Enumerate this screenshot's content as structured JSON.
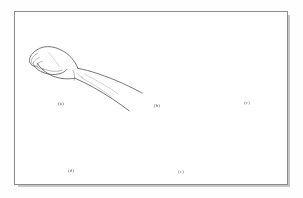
{
  "figure": {
    "type": "line-drawing-plate",
    "medium": "scanned textbook figure",
    "background_color": "#ffffff",
    "frame_color": "#8a8a8c",
    "ink_color": "#5c5c61",
    "panel_count": 5,
    "panels": [
      {
        "id": "a",
        "caption": "(a)",
        "subject": "hand-fist-lateral-view",
        "description": "Closed fist seen from the radial side with the forearm extending toward the lower right."
      },
      {
        "id": "b",
        "caption": "(b)",
        "subject": "hand-open-palm-thumb-adducted",
        "description": "Open hand, palmar surface toward the viewer, fingers extended upward with the thumb folded across the palm."
      },
      {
        "id": "c",
        "caption": "(c)",
        "subject": "hand-open-palm-thumb-abducted",
        "description": "Open palm with fingers extended upward and the thumb abducted out to the side."
      },
      {
        "id": "d",
        "caption": "(d)",
        "subject": "hand-wrist-flexion-lateral-view",
        "description": "Lateral view of the hand and forearm with the wrist flexed so the fingers point downward."
      },
      {
        "id": "e",
        "caption": "(e)",
        "subject": "hand-thumb-opposition-lateral-view",
        "description": "Lateral view of the hand and forearm with the thumb swung downward in opposition, forming a hook."
      }
    ]
  }
}
